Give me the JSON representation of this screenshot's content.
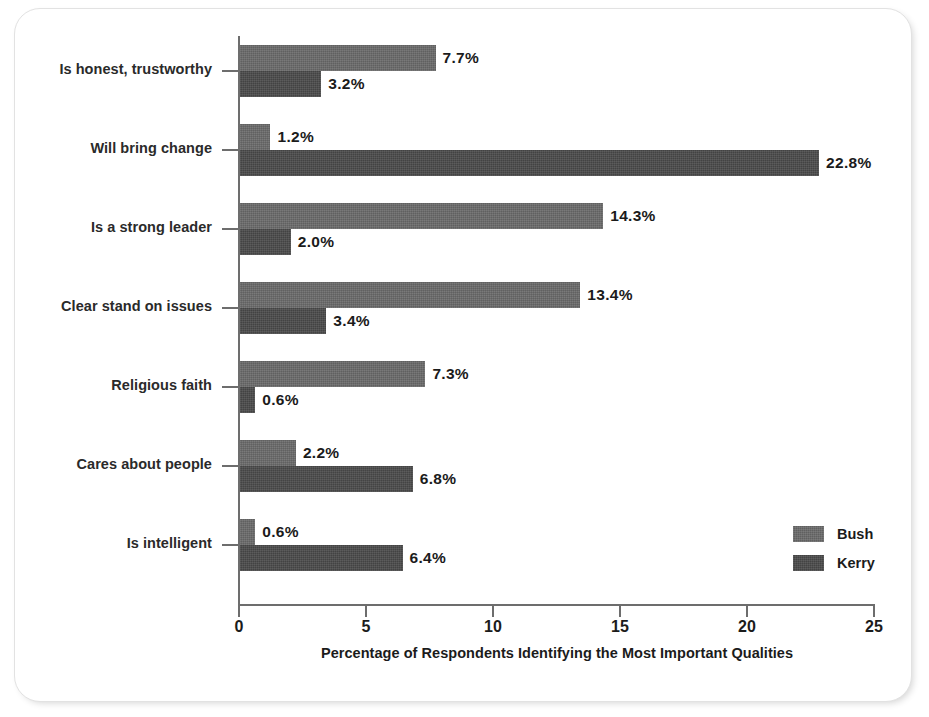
{
  "chart_data": {
    "type": "bar",
    "orientation": "horizontal",
    "title": "",
    "xlabel": "Percentage of Respondents Identifying the Most Important Qualities",
    "ylabel": "",
    "xlim": [
      0,
      25
    ],
    "xticks": [
      "0",
      "5",
      "10",
      "15",
      "20",
      "25"
    ],
    "grid": false,
    "legend_position": "right-inside-bottom",
    "categories": [
      "Is honest, trustworthy",
      "Will bring change",
      "Is a strong leader",
      "Clear stand on issues",
      "Religious faith",
      "Cares about people",
      "Is intelligent"
    ],
    "series": [
      {
        "name": "Bush",
        "color": "#6a6a6a",
        "values": [
          7.7,
          1.2,
          14.3,
          13.4,
          7.3,
          2.2,
          0.6
        ],
        "labels": [
          "7.7%",
          "1.2%",
          "14.3%",
          "13.4%",
          "7.3%",
          "2.2%",
          "0.6%"
        ]
      },
      {
        "name": "Kerry",
        "color": "#4a4a4a",
        "values": [
          3.2,
          22.8,
          2.0,
          3.4,
          0.6,
          6.8,
          6.4
        ],
        "labels": [
          "3.2%",
          "22.8%",
          "2.0%",
          "3.4%",
          "0.6%",
          "6.8%",
          "6.4%"
        ]
      }
    ]
  },
  "legend": {
    "items": [
      {
        "label": "Bush"
      },
      {
        "label": "Kerry"
      }
    ]
  },
  "axis": {
    "x_title": "Percentage of Respondents Identifying the Most Important Qualities",
    "tick_labels": [
      "0",
      "5",
      "10",
      "15",
      "20",
      "25"
    ]
  }
}
